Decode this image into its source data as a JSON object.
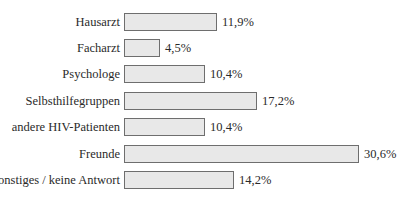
{
  "chart_data": {
    "type": "bar",
    "orientation": "horizontal",
    "title": "",
    "xlabel": "",
    "ylabel": "",
    "categories": [
      "Hausarzt",
      "Facharzt",
      "Psychologe",
      "Selbsthilfegruppen",
      "andere HIV-Patienten",
      "Freunde",
      "Sonstiges / keine Antwort"
    ],
    "values": [
      11.9,
      4.5,
      10.4,
      17.2,
      10.4,
      30.6,
      14.2
    ],
    "value_labels": [
      "11,9%",
      "4,5%",
      "10,4%",
      "17,2%",
      "10,4%",
      "30,6%",
      "14,2%"
    ],
    "unit": "%",
    "grid": false,
    "legend": null,
    "xlim": [
      0,
      31
    ],
    "colors": {
      "bar_fill": "#e8e8e8",
      "bar_border": "#6e6e6e",
      "text": "#2a2a2a"
    }
  },
  "rows": [
    {
      "label": "Hausarzt",
      "value": 11.9,
      "value_label": "11,9%"
    },
    {
      "label": "Facharzt",
      "value": 4.5,
      "value_label": "4,5%"
    },
    {
      "label": "Psychologe",
      "value": 10.4,
      "value_label": "10,4%"
    },
    {
      "label": "Selbsthilfegruppen",
      "value": 17.2,
      "value_label": "17,2%"
    },
    {
      "label": "andere HIV-Patienten",
      "value": 10.4,
      "value_label": "10,4%"
    },
    {
      "label": "Freunde",
      "value": 30.6,
      "value_label": "30,6%"
    },
    {
      "label": "Sonstiges / keine Antwort",
      "value": 14.2,
      "value_label": "14,2%"
    }
  ]
}
